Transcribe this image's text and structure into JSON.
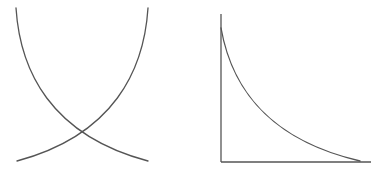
{
  "figure": {
    "panels": [
      {
        "id": "left",
        "description": "Two crossing curves: one decreasing, one increasing",
        "curves": [
          {
            "name": "decreasing-curve",
            "path": "M16,8 C20,70 50,135 148,161"
          },
          {
            "name": "increasing-curve",
            "path": "M148,8 C144,70 114,135 17,161"
          }
        ],
        "axes": false
      },
      {
        "id": "right",
        "description": "Decaying curve on axes",
        "axes": {
          "y_axis": {
            "x": 221,
            "y1": 14,
            "y2": 162
          },
          "x_axis": {
            "y": 162,
            "x1": 221,
            "x2": 371
          }
        },
        "curves": [
          {
            "name": "decay-curve",
            "path": "M221,28 C232,90 270,140 360,161"
          }
        ]
      }
    ],
    "colors": {
      "stroke": "#555555",
      "background": "#ffffff"
    }
  }
}
